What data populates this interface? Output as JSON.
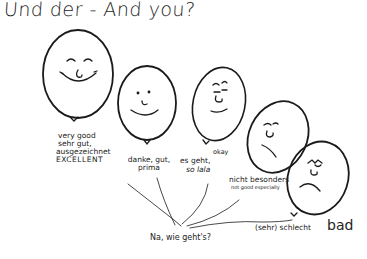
{
  "title": "Und der -  And you?",
  "question": "Na, wie geht's?",
  "balloons": [
    {
      "mood": "very-good",
      "label_de": "sehr gut, ausgezeichnet",
      "label_en_top": "very good",
      "label_en_bottom": "EXCELLENT"
    },
    {
      "mood": "good",
      "label_de_1": "danke, gut,",
      "label_de_2": "prima"
    },
    {
      "mood": "okay",
      "label_de_1": "es geht,",
      "label_de_2": "so lala",
      "label_en": "okay"
    },
    {
      "mood": "not-good",
      "label_de": "nicht besonders",
      "label_en": "not good especially"
    },
    {
      "mood": "bad",
      "label_de": "(sehr) schlecht",
      "label_en": "bad"
    }
  ],
  "labels": {
    "very_good": "very good",
    "sehr_gut": "sehr gut,",
    "ausgezeichnet": "ausgezeichnet",
    "excellent": "EXCELLENT",
    "danke": "danke, gut,",
    "prima": "prima",
    "es_geht": "es geht,",
    "so_lala": "so lala",
    "okay": "okay",
    "nicht_besonders": "nicht besonders",
    "not_especially": "not  good especially",
    "schlecht": "(sehr) schlecht",
    "bad": "bad"
  }
}
